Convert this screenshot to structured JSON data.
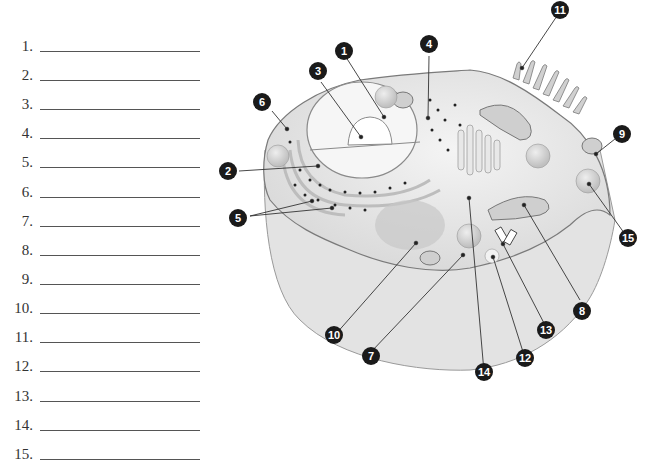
{
  "worksheet": {
    "answer_blanks": [
      {
        "number": "1.",
        "value": ""
      },
      {
        "number": "2.",
        "value": ""
      },
      {
        "number": "3.",
        "value": ""
      },
      {
        "number": "4.",
        "value": ""
      },
      {
        "number": "5.",
        "value": ""
      },
      {
        "number": "6.",
        "value": ""
      },
      {
        "number": "7.",
        "value": ""
      },
      {
        "number": "8.",
        "value": ""
      },
      {
        "number": "9.",
        "value": ""
      },
      {
        "number": "10.",
        "value": ""
      },
      {
        "number": "11.",
        "value": ""
      },
      {
        "number": "12.",
        "value": ""
      },
      {
        "number": "13.",
        "value": ""
      },
      {
        "number": "14.",
        "value": ""
      },
      {
        "number": "15.",
        "value": ""
      }
    ]
  },
  "diagram": {
    "callouts": [
      "1",
      "2",
      "3",
      "4",
      "5",
      "6",
      "7",
      "8",
      "9",
      "10",
      "11",
      "12",
      "13",
      "14",
      "15"
    ],
    "colors": {
      "cell_fill": "#e6e6e6",
      "cell_stroke": "#8a8a8a",
      "callout_fill": "#1a1a1a",
      "callout_text": "#ffffff",
      "leader_line": "#333333"
    }
  }
}
